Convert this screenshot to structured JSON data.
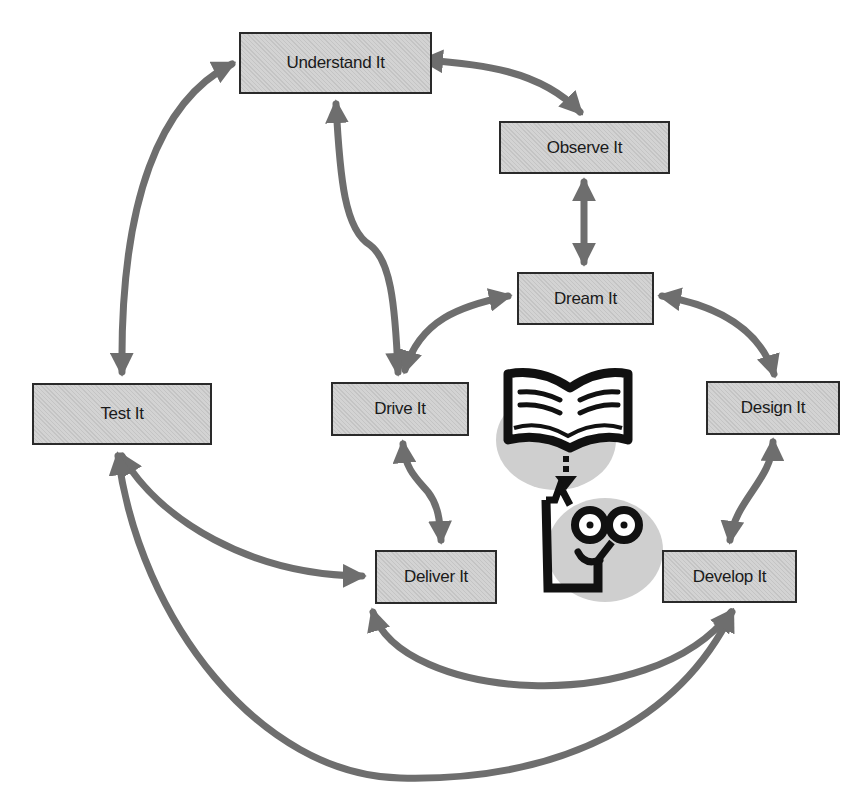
{
  "diagram": {
    "type": "cycle-flow",
    "colors": {
      "node_fill": "#d3d3d3",
      "node_border": "#2a2a2a",
      "arrow": "#6e6e6e",
      "icon_black": "#111111",
      "icon_shadow": "#cfcfcf"
    },
    "nodes": [
      {
        "id": "understand",
        "label": "Understand It"
      },
      {
        "id": "observe",
        "label": "Observe It"
      },
      {
        "id": "dream",
        "label": "Dream It"
      },
      {
        "id": "test",
        "label": "Test It"
      },
      {
        "id": "drive",
        "label": "Drive It"
      },
      {
        "id": "design",
        "label": "Design It"
      },
      {
        "id": "deliver",
        "label": "Deliver It"
      },
      {
        "id": "develop",
        "label": "Develop It"
      }
    ],
    "edges": [
      {
        "from": "understand",
        "to": "observe",
        "bidirectional": true
      },
      {
        "from": "understand",
        "to": "test",
        "bidirectional": true
      },
      {
        "from": "understand",
        "to": "drive",
        "bidirectional": true
      },
      {
        "from": "observe",
        "to": "dream",
        "bidirectional": true
      },
      {
        "from": "dream",
        "to": "drive",
        "bidirectional": true
      },
      {
        "from": "dream",
        "to": "design",
        "bidirectional": true
      },
      {
        "from": "drive",
        "to": "deliver",
        "bidirectional": true
      },
      {
        "from": "design",
        "to": "develop",
        "bidirectional": true
      },
      {
        "from": "test",
        "to": "deliver",
        "bidirectional": true
      },
      {
        "from": "deliver",
        "to": "develop",
        "bidirectional": true
      },
      {
        "from": "test",
        "to": "develop",
        "bidirectional": true
      }
    ],
    "illustration": {
      "icons": [
        "open-book-icon",
        "download-arrow-icon",
        "thinking-face-icon"
      ]
    }
  }
}
